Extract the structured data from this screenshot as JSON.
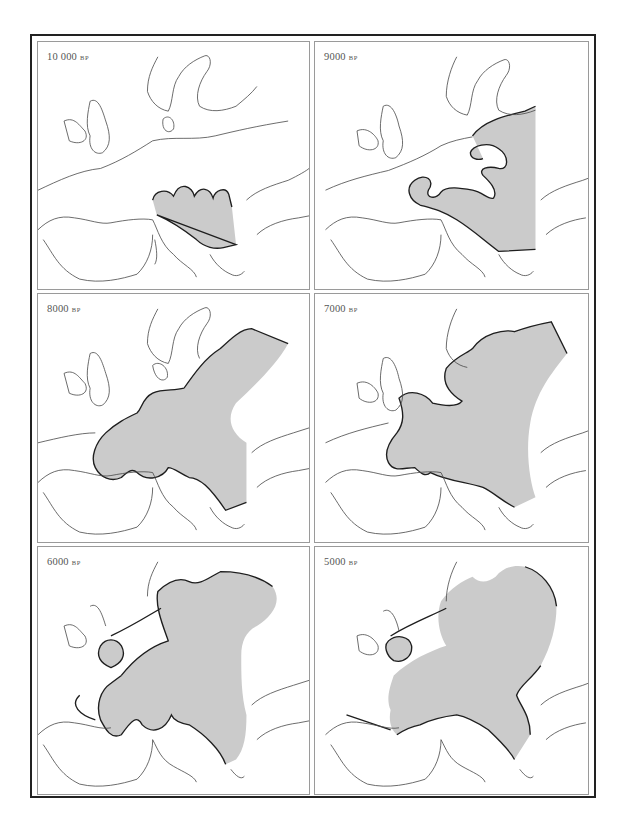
{
  "figure": {
    "fill_color": "#cbcbcb",
    "border_color": "#1e1e1e",
    "coast_color": "#4a4a4a",
    "panels": [
      {
        "label": "10 000",
        "unit": "BP",
        "position": "top-left"
      },
      {
        "label": "9000",
        "unit": "BP",
        "position": "top-right"
      },
      {
        "label": "8000",
        "unit": "BP",
        "position": "middle-left"
      },
      {
        "label": "7000",
        "unit": "BP",
        "position": "middle-right"
      },
      {
        "label": "6000",
        "unit": "BP",
        "position": "bottom-left"
      },
      {
        "label": "5000",
        "unit": "BP",
        "position": "bottom-right"
      }
    ]
  }
}
